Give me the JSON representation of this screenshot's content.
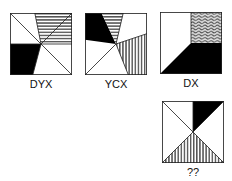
{
  "puzzle": {
    "type": "visual-analogy-code",
    "tiles": [
      {
        "code": "DYX",
        "description": "Square with diagonal top-left to bottom-right; horizontal-striped upper-right region, black lower-left region"
      },
      {
        "code": "YCX",
        "description": "Square with black upper-left region, horizontal-striped top wedge, vertical-striped right wedge, diagonal to bottom-left corner"
      },
      {
        "code": "DX",
        "description": "Square split at center: wavy-patterned top-right quadrant, black lower area with triangle to bottom-left"
      },
      {
        "code": "??",
        "description": "Square with diagonal from top-left to center; black triangle top-right, vertical-striped triangle at bottom"
      }
    ]
  },
  "colors": {
    "stroke": "#222222",
    "black": "#000000",
    "stripe": "#555555",
    "background": "#ffffff"
  }
}
